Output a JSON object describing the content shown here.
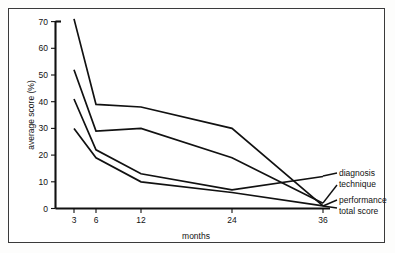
{
  "chart_data": {
    "type": "line",
    "title": "",
    "xlabel": "months",
    "ylabel": "average score (%)",
    "categories": [
      "3",
      "6",
      "12",
      "24",
      "36"
    ],
    "x_tick_labels": [
      "3",
      "6",
      "12",
      "24",
      "36"
    ],
    "y_tick_labels": [
      "0",
      "10",
      "20",
      "30",
      "40",
      "50",
      "60",
      "70"
    ],
    "y_ticks": [
      0,
      10,
      20,
      30,
      40,
      50,
      60,
      70
    ],
    "ylim": [
      0,
      70
    ],
    "grid": false,
    "legend_position": "right-inline-labels",
    "line_color": "#111111",
    "series": [
      {
        "name": "total score",
        "values": [
          71,
          39,
          38,
          30,
          1
        ]
      },
      {
        "name": "technique",
        "values": [
          52,
          29,
          30,
          19,
          2
        ]
      },
      {
        "name": "diagnosis",
        "values": [
          41,
          22,
          13,
          7,
          12
        ]
      },
      {
        "name": "performance",
        "values": [
          30,
          19,
          10,
          6,
          1
        ]
      }
    ],
    "annotations": [
      {
        "text": "diagnosis"
      },
      {
        "text": "technique"
      },
      {
        "text": "performance"
      },
      {
        "text": "total score"
      }
    ]
  },
  "axes": {
    "y_title": "average score (%)",
    "x_title": "months"
  },
  "legend": {
    "items": [
      {
        "label": "diagnosis"
      },
      {
        "label": "technique"
      },
      {
        "label": "performance"
      },
      {
        "label": "total score"
      }
    ]
  }
}
